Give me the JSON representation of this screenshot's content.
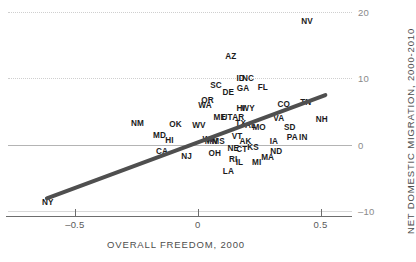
{
  "chart_data": {
    "type": "scatter",
    "title": "",
    "xlabel": "OVERALL FREEDOM, 2000",
    "ylabel": "NET DOMESTIC MIGRATION, 2000-2010",
    "xlim": [
      -0.78,
      0.62
    ],
    "ylim": [
      -12.5,
      21.5
    ],
    "xticks": [
      -0.5,
      0,
      0.5
    ],
    "xtick_labels": [
      "-0.5",
      "0",
      "0.5"
    ],
    "yticks": [
      20,
      10,
      0,
      -10
    ],
    "ytick_labels": [
      "20",
      "10",
      "0",
      "-10"
    ],
    "grid": "horizontal dotted at 20 and 10, solid baseline at 0 and -10",
    "legend": "none",
    "point_label_field": "state abbreviation",
    "trendline": {
      "x_start": -0.62,
      "y_start": -8.2,
      "x_end": 0.53,
      "y_end": 7.6,
      "color": "#4f4f4f"
    },
    "points": [
      {
        "label": "NV",
        "x": 0.445,
        "y": 18.6
      },
      {
        "label": "AZ",
        "x": 0.135,
        "y": 13.4
      },
      {
        "label": "ID",
        "x": 0.175,
        "y": 10.1
      },
      {
        "label": "NC",
        "x": 0.205,
        "y": 10.1
      },
      {
        "label": "SC",
        "x": 0.075,
        "y": 9.0
      },
      {
        "label": "GA",
        "x": 0.185,
        "y": 8.5
      },
      {
        "label": "FL",
        "x": 0.265,
        "y": 8.7
      },
      {
        "label": "DE",
        "x": 0.125,
        "y": 8.0
      },
      {
        "label": "OR",
        "x": 0.04,
        "y": 6.7
      },
      {
        "label": "WA",
        "x": 0.03,
        "y": 6.0
      },
      {
        "label": "CO",
        "x": 0.35,
        "y": 6.2
      },
      {
        "label": "TN",
        "x": 0.44,
        "y": 6.4
      },
      {
        "label": "HI",
        "x": 0.175,
        "y": 5.6
      },
      {
        "label": "WY",
        "x": 0.205,
        "y": 5.6
      },
      {
        "label": "ME",
        "x": 0.09,
        "y": 4.1
      },
      {
        "label": "UT",
        "x": 0.12,
        "y": 4.1
      },
      {
        "label": "AR",
        "x": 0.165,
        "y": 4.2
      },
      {
        "label": "TX",
        "x": 0.175,
        "y": 3.2
      },
      {
        "label": "VA",
        "x": 0.33,
        "y": 4.0
      },
      {
        "label": "NH",
        "x": 0.505,
        "y": 3.8
      },
      {
        "label": "NM",
        "x": -0.245,
        "y": 3.2
      },
      {
        "label": "OK",
        "x": -0.09,
        "y": 3.1
      },
      {
        "label": "WV",
        "x": 0.005,
        "y": 3.0
      },
      {
        "label": "AL",
        "x": 0.215,
        "y": 2.9
      },
      {
        "label": "MO",
        "x": 0.25,
        "y": 2.7
      },
      {
        "label": "SD",
        "x": 0.375,
        "y": 2.6
      },
      {
        "label": "MD",
        "x": -0.155,
        "y": 1.4
      },
      {
        "label": "VT",
        "x": 0.16,
        "y": 1.3
      },
      {
        "label": "MN",
        "x": 0.055,
        "y": 0.6
      },
      {
        "label": "MS",
        "x": 0.085,
        "y": 0.5
      },
      {
        "label": "AK",
        "x": 0.195,
        "y": 0.6
      },
      {
        "label": "IA",
        "x": 0.31,
        "y": 0.5
      },
      {
        "label": "PA",
        "x": 0.385,
        "y": 1.2
      },
      {
        "label": "IN",
        "x": 0.43,
        "y": 1.1
      },
      {
        "label": "WI",
        "x": 0.04,
        "y": 0.9
      },
      {
        "label": "NE",
        "x": 0.145,
        "y": -0.5
      },
      {
        "label": "CT",
        "x": 0.18,
        "y": -0.7
      },
      {
        "label": "KS",
        "x": 0.225,
        "y": -0.4
      },
      {
        "label": "ND",
        "x": 0.32,
        "y": -0.9
      },
      {
        "label": "HI2",
        "x": -0.115,
        "y": 0.7
      },
      {
        "label": "CA",
        "x": -0.145,
        "y": -1.0
      },
      {
        "label": "NJ",
        "x": -0.045,
        "y": -1.7
      },
      {
        "label": "OH",
        "x": 0.07,
        "y": -1.3
      },
      {
        "label": "RI",
        "x": 0.145,
        "y": -2.2
      },
      {
        "label": "IL",
        "x": 0.17,
        "y": -2.6
      },
      {
        "label": "MI",
        "x": 0.24,
        "y": -2.6
      },
      {
        "label": "MA",
        "x": 0.285,
        "y": -1.9
      },
      {
        "label": "LA",
        "x": 0.125,
        "y": -4.0
      },
      {
        "label": "NY",
        "x": -0.61,
        "y": -8.7
      }
    ]
  },
  "axes": {
    "x_title": "OVERALL FREEDOM, 2000",
    "y_title": "NET DOMESTIC MIGRATION, 2000-2010"
  }
}
